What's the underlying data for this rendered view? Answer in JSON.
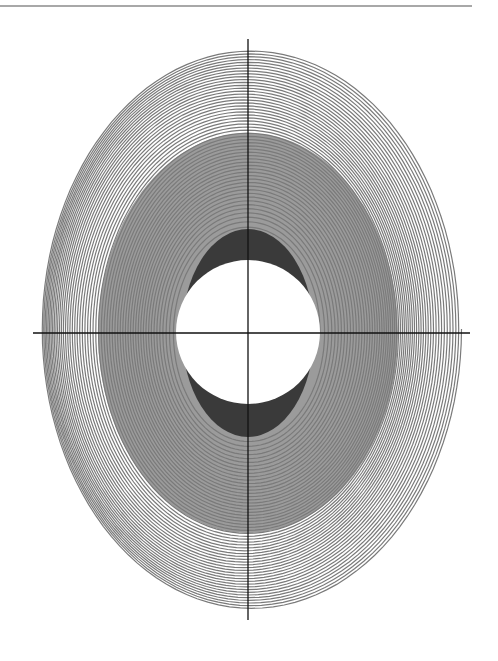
{
  "chart_data": {
    "type": "line",
    "title": "",
    "xlabel": "",
    "ylabel": "",
    "grid": false,
    "legend": null,
    "axes": {
      "origin_px": [
        248,
        333
      ],
      "x_axis_px": [
        33,
        470
      ],
      "y_axis_px": [
        39,
        620
      ]
    },
    "spiral": {
      "turns": 55,
      "inner_radii_px": [
        72,
        104
      ],
      "outer_radii_px": [
        210,
        280
      ],
      "drift_px": [
        6,
        -4
      ],
      "end_point_px": [
        455,
        392
      ],
      "line_color": "#7a7a7a"
    },
    "inner_disc": {
      "rx": 72,
      "ry": 72,
      "color": "#ffffff"
    },
    "dark_band": {
      "rx": 66,
      "ry": 104,
      "color": "#3a3a3a"
    },
    "fill_color": "#8a8a8a",
    "axis_color": "#111111"
  }
}
